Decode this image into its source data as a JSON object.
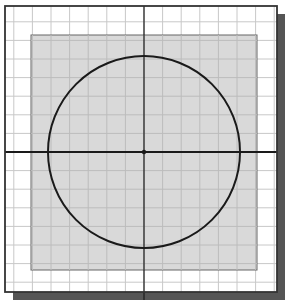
{
  "diagram": {
    "type": "cad-sketch-grid",
    "colors": {
      "background": "#ffffff",
      "frame": "#333333",
      "shadow": "#555555",
      "grid": "#c8c8c8",
      "shaded_region": "#d9d9d9",
      "axes": "#1a1a1a",
      "circle": "#1a1a1a"
    },
    "frame": {
      "x": 5,
      "y": 6,
      "width": 272,
      "height": 286
    },
    "shadow": {
      "offset": 8
    },
    "grid": {
      "spacing": 18.6,
      "origin_x": 144,
      "origin_y": 152
    },
    "shaded_region": {
      "x": 31,
      "y": 35,
      "width": 226,
      "height": 235
    },
    "axes": {
      "origin_x": 144,
      "origin_y": 152
    },
    "circle": {
      "cx": 144,
      "cy": 152,
      "r": 96
    },
    "center_point": {
      "x": 144,
      "y": 152
    }
  }
}
